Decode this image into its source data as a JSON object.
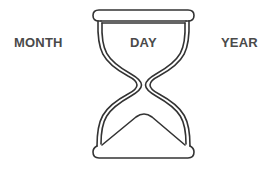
{
  "labels": {
    "left": "MONTH",
    "center": "DAY",
    "right": "YEAR"
  },
  "icon": {
    "name": "hourglass-icon",
    "stroke_color": "#333333",
    "background": "#ffffff"
  },
  "text_color": "#4a4a4a"
}
